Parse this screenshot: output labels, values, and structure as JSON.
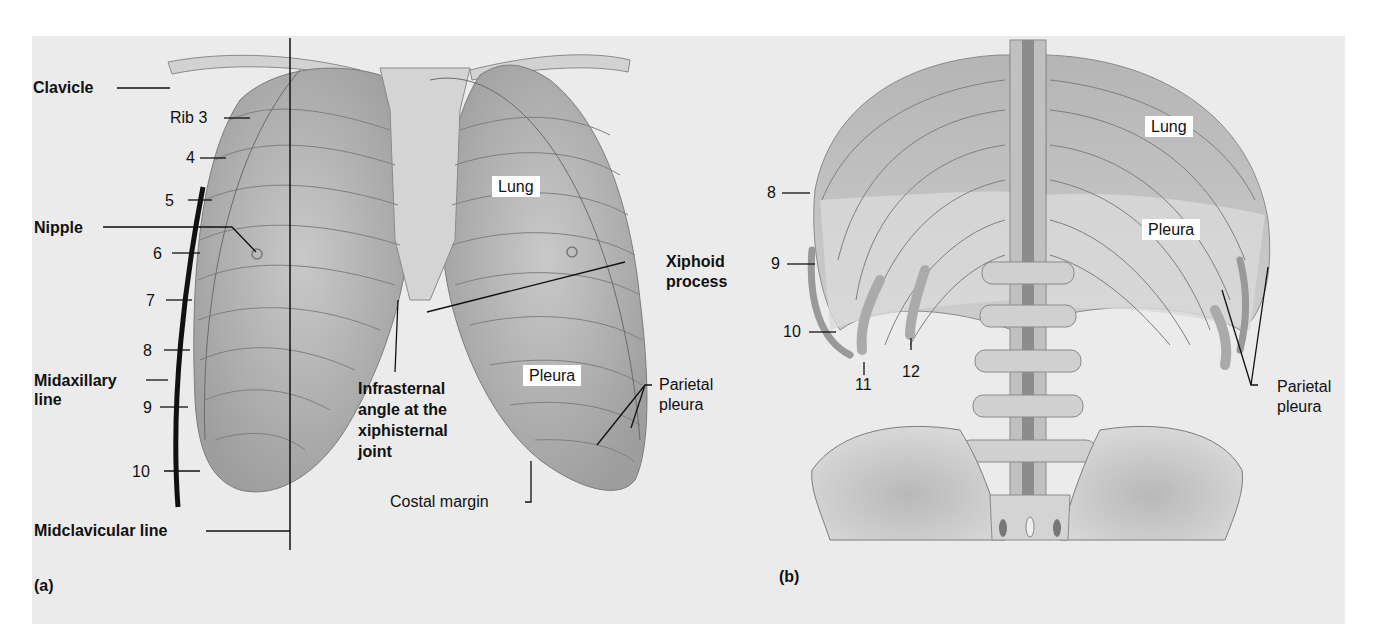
{
  "figure": {
    "panel_a": {
      "caption": "(a)",
      "view": "anterior thorax",
      "labels": {
        "clavicle": "Clavicle",
        "rib3": "Rib 3",
        "rib4": "4",
        "rib5": "5",
        "nipple": "Nipple",
        "rib6": "6",
        "rib7": "7",
        "rib8": "8",
        "midaxillary_line_1": "Midaxillary",
        "midaxillary_line_2": "line",
        "rib9": "9",
        "rib10": "10",
        "midclavicular_line": "Midclavicular line",
        "lung": "Lung",
        "xiphoid_1": "Xiphoid",
        "xiphoid_2": "process",
        "infrasternal_1": "Infrasternal",
        "infrasternal_2": "angle at the",
        "infrasternal_3": "xiphisternal",
        "infrasternal_4": "joint",
        "pleura": "Pleura",
        "parietal_1": "Parietal",
        "parietal_2": "pleura",
        "costal_margin": "Costal margin"
      }
    },
    "panel_b": {
      "caption": "(b)",
      "view": "posterior thorax",
      "labels": {
        "rib8": "8",
        "rib9": "9",
        "rib10": "10",
        "rib11": "11",
        "rib12": "12",
        "lung": "Lung",
        "pleura": "Pleura",
        "parietal_1": "Parietal",
        "parietal_2": "pleura"
      }
    },
    "colors": {
      "background": "#ebebeb",
      "bone": "#cfcfcf",
      "lung": "#a9a9a9",
      "line": "#111111",
      "label_box": "#ffffff"
    }
  }
}
